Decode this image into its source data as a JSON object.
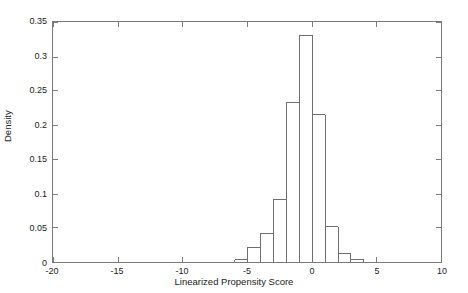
{
  "chart_data": {
    "type": "bar",
    "subtype": "histogram",
    "title": "",
    "xlabel": "Linearized Propensity Score",
    "ylabel": "Density",
    "xlim": [
      -20,
      10
    ],
    "ylim": [
      0,
      0.35
    ],
    "grid": false,
    "legend": null,
    "bin_width": 1,
    "bin_edges": [
      -6,
      -5,
      -4,
      -3,
      -2,
      -1,
      0,
      1,
      2,
      3,
      4
    ],
    "categories": [
      "-6 to -5",
      "-5 to -4",
      "-4 to -3",
      "-3 to -2",
      "-2 to -1",
      "-1 to 0",
      "0 to 1",
      "1 to 2",
      "2 to 3",
      "3 to 4"
    ],
    "values": [
      0.004,
      0.021,
      0.042,
      0.093,
      0.233,
      0.331,
      0.216,
      0.052,
      0.013,
      0.004
    ],
    "xticks": [
      -20,
      -15,
      -10,
      -5,
      0,
      5,
      10
    ],
    "xtick_labels": [
      "-20",
      "-15",
      "-10",
      "-5",
      "0",
      "5",
      "10"
    ],
    "yticks": [
      0,
      0.05,
      0.1,
      0.15,
      0.2,
      0.25,
      0.3,
      0.35
    ],
    "ytick_labels": [
      "0",
      "0.05",
      "0.1",
      "0.15",
      "0.2",
      "0.25",
      "0.3",
      "0.35"
    ],
    "bar_stroke_color": "#6e6e6e",
    "bar_fill_color": "none",
    "axis_color": "#7a7a7a",
    "background_color": "#ffffff"
  }
}
